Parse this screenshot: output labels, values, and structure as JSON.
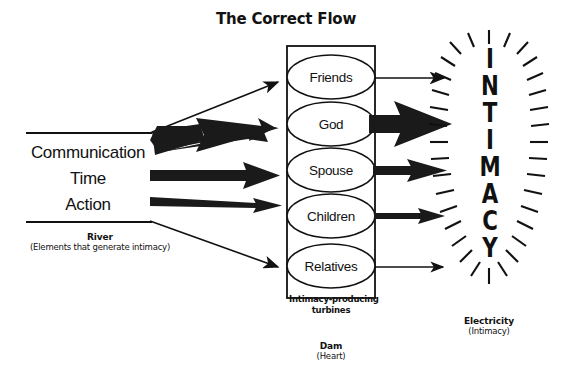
{
  "title": "The Correct Flow",
  "river": {
    "lines": [
      "Communication",
      "Time",
      "Action"
    ],
    "caption": "River",
    "subcaption": "(Elements that generate intimacy)"
  },
  "dam": {
    "caption": "Dam",
    "subcaption": "(Heart)",
    "turbine_label_line1": "Intimacy-producing",
    "turbine_label_line2": "turbines",
    "nodes": [
      {
        "label": "Friends"
      },
      {
        "label": "God"
      },
      {
        "label": "Spouse"
      },
      {
        "label": "Children"
      },
      {
        "label": "Relatives"
      }
    ]
  },
  "output": {
    "word": "INTIMACY",
    "letters": [
      "I",
      "N",
      "T",
      "I",
      "M",
      "A",
      "C",
      "Y"
    ],
    "caption": "Electricity",
    "subcaption": "(Intimacy)"
  },
  "colors": {
    "ink": "#111111",
    "background": "#ffffff"
  }
}
